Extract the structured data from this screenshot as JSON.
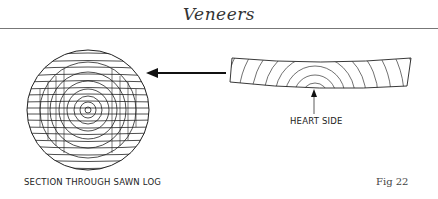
{
  "header": {
    "title": "Veneers"
  },
  "figure": {
    "number_label": "Fig 22",
    "log_caption": "SECTION THROUGH SAWN LOG",
    "heart_label": "HEART SIDE",
    "elements": [
      {
        "name": "sawn-log-cross-section",
        "description": "Circular log section sliced into horizontal veneer strips with concentric growth rings"
      },
      {
        "name": "transfer-arrow",
        "direction": "left",
        "from": "veneer",
        "to": "log"
      },
      {
        "name": "veneer-strip",
        "description": "Single bowed veneer leaf showing ring arcs"
      },
      {
        "name": "heart-side-arrow",
        "direction": "up"
      }
    ]
  },
  "colors": {
    "ink": "#222222",
    "rule": "#777777",
    "background": "#ffffff"
  }
}
